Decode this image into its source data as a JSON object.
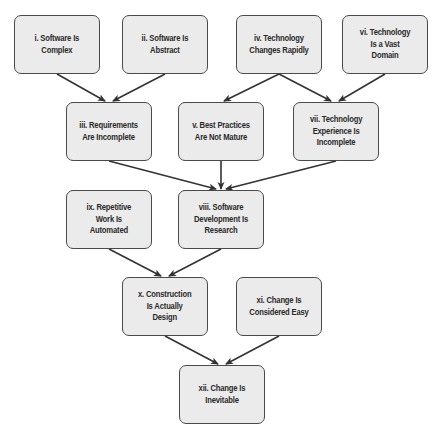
{
  "diagram": {
    "type": "dependency-flow",
    "colors": {
      "node_fill": "#ebebeb",
      "node_border": "#4a4a4a",
      "text": "#2a2a2a",
      "arrow": "#333333",
      "background": "#ffffff"
    },
    "nodes": [
      {
        "id": "i",
        "label": "i. Software Is\nComplex",
        "x": 14,
        "y": 15,
        "w": 86,
        "h": 59
      },
      {
        "id": "ii",
        "label": "ii. Software Is\nAbstract",
        "x": 122,
        "y": 15,
        "w": 86,
        "h": 59
      },
      {
        "id": "iv",
        "label": "iv. Technology\nChanges Rapidly",
        "x": 236,
        "y": 15,
        "w": 86,
        "h": 59
      },
      {
        "id": "vi",
        "label": "vi. Technology\nIs a Vast\nDomain",
        "x": 342,
        "y": 15,
        "w": 86,
        "h": 59
      },
      {
        "id": "iii",
        "label": "iii. Requirements\nAre Incomplete",
        "x": 66,
        "y": 102,
        "w": 86,
        "h": 59
      },
      {
        "id": "v",
        "label": "v. Best Practices\nAre Not Mature",
        "x": 178,
        "y": 102,
        "w": 86,
        "h": 59
      },
      {
        "id": "vii",
        "label": "vii. Technology\nExperience Is\nIncomplete",
        "x": 293,
        "y": 102,
        "w": 86,
        "h": 59
      },
      {
        "id": "ix",
        "label": "ix. Repetitive\nWork Is\nAutomated",
        "x": 66,
        "y": 190,
        "w": 86,
        "h": 59
      },
      {
        "id": "viii",
        "label": "viii. Software\nDevelopment Is\nResearch",
        "x": 178,
        "y": 190,
        "w": 86,
        "h": 59
      },
      {
        "id": "x",
        "label": "x. Construction\nIs Actually\nDesign",
        "x": 122,
        "y": 277,
        "w": 86,
        "h": 59
      },
      {
        "id": "xi",
        "label": "xi. Change Is\nConsidered Easy",
        "x": 236,
        "y": 277,
        "w": 86,
        "h": 59
      },
      {
        "id": "xii",
        "label": "xii. Change Is\nInevitable",
        "x": 179,
        "y": 365,
        "w": 86,
        "h": 59
      }
    ],
    "edges": [
      {
        "from": "i",
        "to": "iii",
        "x1": 57,
        "y1": 74,
        "x2": 105,
        "y2": 101
      },
      {
        "from": "ii",
        "to": "iii",
        "x1": 165,
        "y1": 74,
        "x2": 113,
        "y2": 101
      },
      {
        "from": "iv",
        "to": "v",
        "x1": 279,
        "y1": 74,
        "x2": 224,
        "y2": 101
      },
      {
        "from": "iv",
        "to": "vii",
        "x1": 279,
        "y1": 74,
        "x2": 331,
        "y2": 101
      },
      {
        "from": "vi",
        "to": "vii",
        "x1": 385,
        "y1": 74,
        "x2": 339,
        "y2": 101
      },
      {
        "from": "iii",
        "to": "viii",
        "x1": 109,
        "y1": 161,
        "x2": 216,
        "y2": 189
      },
      {
        "from": "v",
        "to": "viii",
        "x1": 221,
        "y1": 161,
        "x2": 221,
        "y2": 189
      },
      {
        "from": "vii",
        "to": "viii",
        "x1": 336,
        "y1": 161,
        "x2": 226,
        "y2": 189
      },
      {
        "from": "ix",
        "to": "x",
        "x1": 109,
        "y1": 249,
        "x2": 161,
        "y2": 276
      },
      {
        "from": "viii",
        "to": "x",
        "x1": 221,
        "y1": 249,
        "x2": 169,
        "y2": 276
      },
      {
        "from": "x",
        "to": "xii",
        "x1": 165,
        "y1": 336,
        "x2": 218,
        "y2": 364
      },
      {
        "from": "xi",
        "to": "xii",
        "x1": 279,
        "y1": 336,
        "x2": 226,
        "y2": 364
      }
    ]
  }
}
